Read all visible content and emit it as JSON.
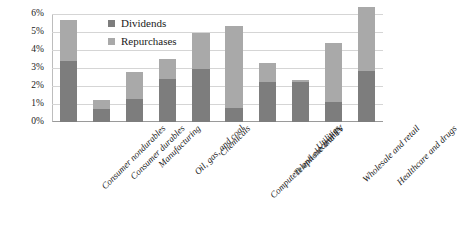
{
  "chart_data": {
    "type": "bar",
    "stacked": true,
    "title": "",
    "subtitle": "",
    "xlabel": "",
    "ylabel": "",
    "ylim": [
      0,
      6
    ],
    "ytick_labels": [
      "0%",
      "1%",
      "2%",
      "3%",
      "4%",
      "5%",
      "6%"
    ],
    "ytick_values": [
      0,
      1,
      2,
      3,
      4,
      5,
      6
    ],
    "grid": true,
    "legend_position": "inside-top-left",
    "categories": [
      "Consumer nondurables",
      "Consumer durables",
      "Manufacturing",
      "Oil, gas, and coal",
      "Chemicals",
      "Computers and electronics",
      "Telephone and TV",
      "Utilities",
      "Wholesale and retail",
      "Healthcare and drugs"
    ],
    "series": [
      {
        "name": "Dividends",
        "color": "#7d7d7d",
        "values": [
          3.4,
          0.7,
          1.3,
          2.4,
          2.95,
          0.8,
          2.2,
          2.2,
          1.1,
          2.85
        ]
      },
      {
        "name": "Repurchases",
        "color": "#a9a9a9",
        "values": [
          2.25,
          0.55,
          1.5,
          1.1,
          2.0,
          4.55,
          1.1,
          0.15,
          3.3,
          3.55
        ]
      }
    ],
    "totals": [
      5.65,
      1.25,
      2.8,
      3.5,
      4.95,
      5.35,
      3.3,
      2.35,
      4.4,
      6.4
    ]
  },
  "legend": {
    "entries": [
      {
        "label": "Dividends",
        "color": "#7d7d7d"
      },
      {
        "label": "Repurchases",
        "color": "#a9a9a9"
      }
    ]
  },
  "colors": {
    "dividends": "#7d7d7d",
    "repurchases": "#a9a9a9",
    "gridline": "#d5d5d5",
    "axis": "#9a9a9a",
    "background": "#ffffff"
  }
}
